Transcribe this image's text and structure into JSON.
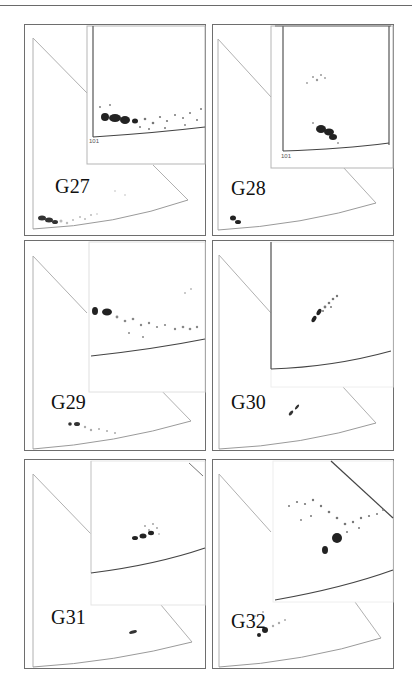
{
  "figure": {
    "panels": [
      {
        "id": "G27",
        "label": "G27",
        "inset_tick": "101"
      },
      {
        "id": "G28",
        "label": "G28",
        "inset_tick": "101"
      },
      {
        "id": "G29",
        "label": "G29",
        "inset_tick": ""
      },
      {
        "id": "G30",
        "label": "G30",
        "inset_tick": ""
      },
      {
        "id": "G31",
        "label": "G31",
        "inset_tick": ""
      },
      {
        "id": "G32",
        "label": "G32",
        "inset_tick": ""
      }
    ]
  },
  "colors": {
    "frame": "#6e6e6e",
    "axis": "#9a9a9a",
    "arc": "#555555",
    "dense": "#1e1e1e",
    "sparse": "#8c8c8c"
  }
}
